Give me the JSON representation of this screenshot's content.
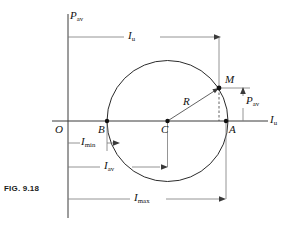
{
  "figure": {
    "caption": "FIG. 9.18",
    "type": "geometric-diagram"
  },
  "axes": {
    "vertical": {
      "label_base": "P",
      "label_sub": "av",
      "label_full": "Pav"
    },
    "horizontal": {
      "label_base": "I",
      "label_sub": "u",
      "label_full": "Iu"
    },
    "origin_label": "O"
  },
  "points": {
    "origin": "O",
    "left_intersection": "B",
    "center": "C",
    "right_intersection": "A",
    "on_circle": "M"
  },
  "radius_label": {
    "base": "R",
    "sub": ""
  },
  "dimensions": [
    {
      "name": "top-current",
      "base": "I",
      "sub": "u"
    },
    {
      "name": "vertical-power",
      "base": "P",
      "sub": "av"
    },
    {
      "name": "minimum-current",
      "base": "I",
      "sub": "min"
    },
    {
      "name": "average-current",
      "base": "I",
      "sub": "av"
    },
    {
      "name": "maximum-current",
      "base": "I",
      "sub": "max"
    }
  ],
  "colors": {
    "line": "#3a3a3a",
    "curve": "#2b2b2b",
    "text": "#111111",
    "background": "#ffffff"
  }
}
